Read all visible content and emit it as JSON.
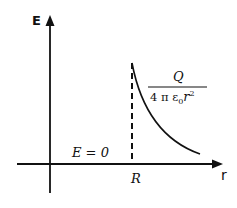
{
  "diagram": {
    "axes": {
      "y_label": "E",
      "x_label": "r"
    },
    "annotations": {
      "inside_label": "E = 0",
      "radius_label": "R",
      "formula_numerator": "Q",
      "formula_denominator_prefix": "4 π ε",
      "formula_denominator_sub": "0",
      "formula_denominator_var": "r",
      "formula_denominator_exp": "2"
    },
    "colors": {
      "stroke": "#111111",
      "background": "#ffffff"
    }
  }
}
